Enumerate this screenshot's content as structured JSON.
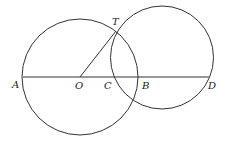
{
  "diagram": {
    "type": "geometry",
    "stroke_color": "#333333",
    "circles": [
      {
        "name": "circle-O",
        "cx": 80,
        "cy": 77,
        "r": 58
      },
      {
        "name": "circle-right",
        "cx": 162,
        "cy": 57.5,
        "r": 51.5
      }
    ],
    "segments": [
      {
        "name": "line-AD",
        "x1": 23,
        "y1": 77,
        "x2": 209,
        "y2": 77
      },
      {
        "name": "segment-OT",
        "x1": 80,
        "y1": 77,
        "x2": 116,
        "y2": 31
      }
    ],
    "labels": {
      "A": {
        "text": "A",
        "x": 12,
        "y": 88
      },
      "O": {
        "text": "O",
        "x": 75,
        "y": 89
      },
      "C": {
        "text": "C",
        "x": 104,
        "y": 89
      },
      "B": {
        "text": "B",
        "x": 142,
        "y": 89
      },
      "D": {
        "text": "D",
        "x": 208,
        "y": 89
      },
      "T": {
        "text": "T",
        "x": 112,
        "y": 25
      }
    }
  }
}
